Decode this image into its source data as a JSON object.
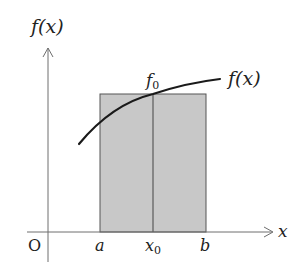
{
  "figure": {
    "colors": {
      "background": "#ffffff",
      "axis": "#6e6e6e",
      "curve": "#1a1a1a",
      "rect_fill": "#c8c8c8",
      "rect_stroke": "#555555",
      "text": "#222222"
    },
    "labels": {
      "y_axis": "f(x)",
      "x_axis": "x",
      "origin": "O",
      "a": "a",
      "x0_main": "x",
      "x0_sub": "0",
      "b": "b",
      "f0_main": "f",
      "f0_sub": "0",
      "curve": "f(x)"
    }
  }
}
